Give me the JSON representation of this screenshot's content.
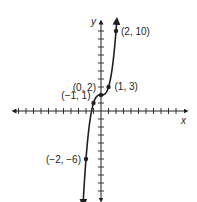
{
  "chart_data": {
    "type": "line",
    "title": "",
    "function": "y = x^3 + 2",
    "xlabel": "x",
    "ylabel": "y",
    "xlim": [
      -12,
      11
    ],
    "ylim": [
      -11,
      11
    ],
    "grid": false,
    "tick_interval": 1,
    "points": [
      {
        "x": 2,
        "y": 10,
        "label": "(2, 10)"
      },
      {
        "x": 1,
        "y": 3,
        "label": "(1, 3)"
      },
      {
        "x": 0,
        "y": 2,
        "label": "(0, 2)"
      },
      {
        "x": -1,
        "y": 1,
        "label": "(−1, 1)"
      },
      {
        "x": -2,
        "y": -6,
        "label": "(−2, −6)"
      }
    ]
  },
  "colors": {
    "ink": "#231f20",
    "background": "#ffffff"
  }
}
